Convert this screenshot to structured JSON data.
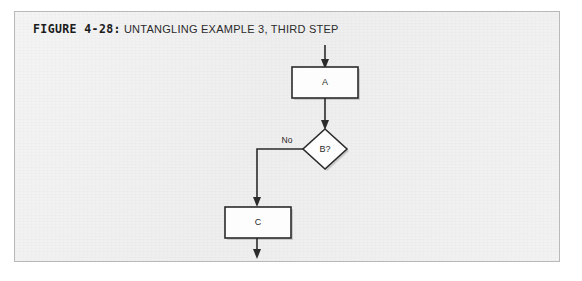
{
  "figure": {
    "number_label": "FIGURE 4-28:",
    "caption": "UNTANGLING EXAMPLE 3, THIRD STEP"
  },
  "colors": {
    "panel_background": "#f1f1f1",
    "panel_border": "#b9b9b9",
    "shape_fill": "#fdfdfd",
    "ink": "#2b2b2b",
    "page_background": "#ffffff"
  },
  "diagram": {
    "type": "flowchart",
    "nodes": [
      {
        "id": "a",
        "label": "A",
        "shape": "process"
      },
      {
        "id": "b",
        "label": "B?",
        "shape": "decision"
      },
      {
        "id": "c",
        "label": "C",
        "shape": "process"
      }
    ],
    "edges": [
      {
        "id": "entry",
        "from": "",
        "to": "a",
        "label": ""
      },
      {
        "id": "a-to-b",
        "from": "a",
        "to": "b",
        "label": ""
      },
      {
        "id": "b-to-c",
        "from": "b",
        "to": "c",
        "label": "No"
      },
      {
        "id": "exit",
        "from": "c",
        "to": "",
        "label": ""
      }
    ],
    "edge_labels": {
      "no": "No"
    }
  }
}
